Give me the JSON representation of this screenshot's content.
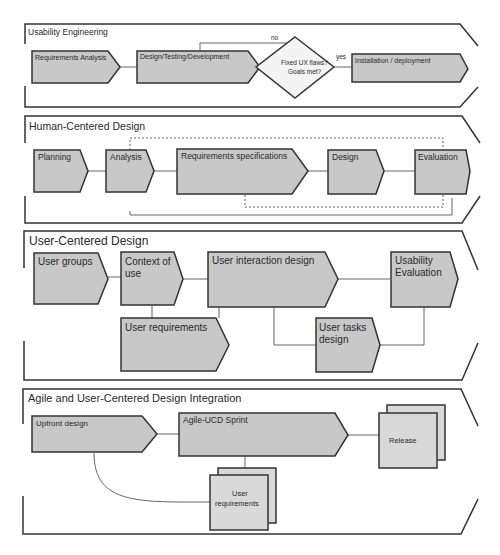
{
  "colors": {
    "shape_fill": "#c8c8c8",
    "shape_stroke": "#333333",
    "light_fill": "#d9d9d9",
    "frame_stroke": "#333333",
    "connector": "#666666"
  },
  "bands": [
    {
      "title": "Usability Engineering",
      "nodes": {
        "requirements_analysis": "Requirements Analysis",
        "design_testing_development": "Design/Testing/Development",
        "decision": "Fixed UX flaws? Goals met?",
        "decision_line1": "Fixed UX flaws?",
        "decision_line2": "Goals met?",
        "installation": "Installation / deployment"
      },
      "edge_labels": {
        "no": "no",
        "yes": "yes"
      }
    },
    {
      "title": "Human-Centered Design",
      "nodes": {
        "planning": "Planning",
        "analysis": "Analysis",
        "requirements_specifications": "Requirements specifications",
        "design": "Design",
        "evaluation": "Evaluation"
      }
    },
    {
      "title": "User-Centered Design",
      "nodes": {
        "user_groups": "User groups",
        "context_of_use_line1": "Context of",
        "context_of_use_line2": "use",
        "user_interaction_design": "User interaction design",
        "usability_evaluation_line1": "Usability",
        "usability_evaluation_line2": "Evaluation",
        "user_requirements": "User requirements",
        "user_tasks_design_line1": "User tasks",
        "user_tasks_design_line2": "design"
      }
    },
    {
      "title": "Agile and User-Centered Design Integration",
      "nodes": {
        "upfront_design": "Upfront design",
        "agile_ucd_sprint": "Agile-UCD Sprint",
        "release": "Release",
        "user_requirements_line1": "User",
        "user_requirements_line2": "requirements"
      }
    }
  ]
}
